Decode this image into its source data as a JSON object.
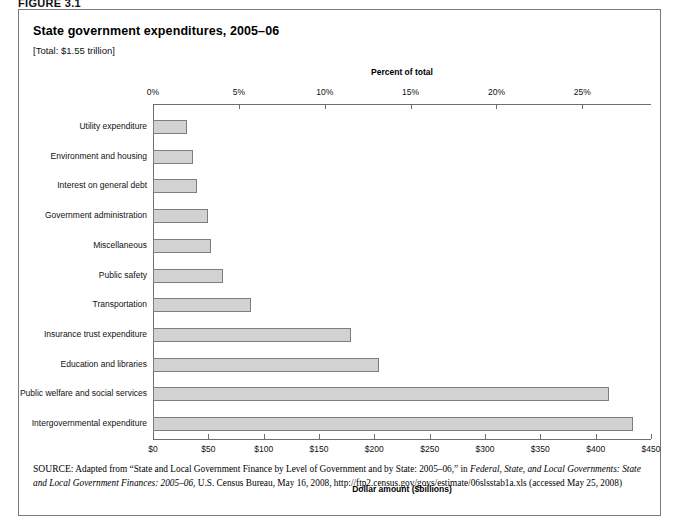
{
  "figure": {
    "label": "FIGURE 3.1"
  },
  "chart": {
    "title": "State government expenditures, 2005–06",
    "subtitle": "[Total: $1.55 trillion]"
  },
  "source": {
    "lead": "SOURCE:",
    "text_1": " Adapted from “State and Local Government Finance by Level of Government and by State: 2005–06,” in ",
    "italic_1": "Federal, State, and Local Governments:",
    "italic_2": "State and Local Government Finances: 2005–06",
    "text_2": ", U.S. Census Bureau, May 16, 2008, http://ftp2.census.gov/govs/estimate/06slsstab1a.xls",
    "text_3": "(accessed May 25, 2008)"
  },
  "chart_data": {
    "type": "bar",
    "orientation": "horizontal",
    "title": "State government expenditures, 2005–06",
    "subtitle": "[Total: $1.55 trillion]",
    "xlabel": "Dollar amount ($billions)",
    "xlabel_top": "Percent of total",
    "ylabel": "",
    "grid": false,
    "legend": null,
    "xlim": [
      0,
      450
    ],
    "xlim_top": [
      0,
      29
    ],
    "xticks": [
      0,
      50,
      100,
      150,
      200,
      250,
      300,
      350,
      400,
      450
    ],
    "xticklabels": [
      "$0",
      "$50",
      "$100",
      "$150",
      "$200",
      "$250",
      "$300",
      "$350",
      "$400",
      "$450"
    ],
    "xticks_top": [
      0,
      5,
      10,
      15,
      20,
      25
    ],
    "xticklabels_top": [
      "0%",
      "5%",
      "10%",
      "15%",
      "20%",
      "25%"
    ],
    "categories": [
      "Utility expenditure",
      "Environment and housing",
      "Interest on general debt",
      "Government administration",
      "Miscellaneous",
      "Public safety",
      "Transportation",
      "Insurance trust expenditure",
      "Education and libraries",
      "Public welfare and social services",
      "Intergovernmental expenditure"
    ],
    "values": [
      31,
      36,
      40,
      50,
      52,
      63,
      89,
      179,
      204,
      412,
      434
    ],
    "values_percent": [
      2.0,
      2.3,
      2.6,
      3.2,
      3.4,
      4.1,
      5.7,
      11.5,
      13.2,
      26.6,
      28.0
    ],
    "bar_color": "#d2d2d2",
    "bar_border_color": "#7e7e7e"
  }
}
